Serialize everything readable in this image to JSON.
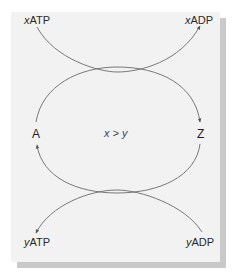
{
  "diagram": {
    "title": "",
    "labels": {
      "top_left": {
        "coef": "x",
        "name": "ATP"
      },
      "top_right": {
        "coef": "x",
        "name": "ADP"
      },
      "left": "A",
      "right": "Z",
      "center": "x > y",
      "bottom_left": {
        "coef": "y",
        "name": "ATP"
      },
      "bottom_right": {
        "coef": "y",
        "name": "ADP"
      }
    },
    "colors": {
      "panel": "#f2f2f2",
      "shadow": "#c9c9c9",
      "line": "#6a6a6a",
      "text": "#2a2a2a"
    },
    "edges": [
      {
        "from": "xATP",
        "to": "xADP",
        "shape": "downward-curve",
        "arrow": "end"
      },
      {
        "from": "A",
        "to": "Z",
        "shape": "upper-arc",
        "arrow": "end"
      },
      {
        "from": "Z",
        "to": "A",
        "shape": "lower-arc",
        "arrow": "end"
      },
      {
        "from": "yADP",
        "to": "yATP",
        "shape": "upward-curve",
        "arrow": "end"
      }
    ]
  }
}
